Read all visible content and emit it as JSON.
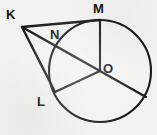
{
  "figure": {
    "type": "circle-geometry-diagram",
    "background_color": "#f2f2f0",
    "stroke_color": "#1a1a1a",
    "canvas": {
      "width": 157,
      "height": 135
    },
    "circle": {
      "name": "main-circle",
      "center_label": "O",
      "cx": 100,
      "cy": 71,
      "r": 51
    },
    "points": [
      {
        "id": "K",
        "label": "K",
        "x": 22,
        "y": 27,
        "on_circle": false,
        "label_x": 6,
        "label_y": 8
      },
      {
        "id": "M",
        "label": "M",
        "x": 100,
        "y": 20,
        "on_circle": true,
        "label_x": 93,
        "label_y": 2
      },
      {
        "id": "N",
        "label": "N",
        "x": 58,
        "y": 43,
        "on_circle": true,
        "label_x": 50,
        "label_y": 27
      },
      {
        "id": "O",
        "label": "O",
        "x": 100,
        "y": 71,
        "on_circle": false,
        "label_x": 103,
        "label_y": 61
      },
      {
        "id": "L",
        "label": "L",
        "x": 55,
        "y": 92,
        "on_circle": true,
        "label_x": 36,
        "label_y": 94
      },
      {
        "id": "P",
        "label": "",
        "x": 146,
        "y": 97,
        "on_circle": true,
        "label_x": 0,
        "label_y": 0
      }
    ],
    "segments": [
      {
        "id": "KM",
        "from": "K",
        "to": "M",
        "name": "segment-km"
      },
      {
        "id": "KL",
        "from": "K",
        "to": "L",
        "name": "segment-kl"
      },
      {
        "id": "KO",
        "from": "K",
        "to": "O",
        "name": "segment-ko-through-n"
      },
      {
        "id": "MO",
        "from": "M",
        "to": "O",
        "name": "segment-mo-radius"
      },
      {
        "id": "LO",
        "from": "L",
        "to": "O",
        "name": "segment-lo-radius"
      },
      {
        "id": "OP",
        "from": "O",
        "to": "P",
        "name": "segment-o-to-circle-radius"
      }
    ],
    "labels": {
      "k": "K",
      "m": "M",
      "n": "N",
      "o": "O",
      "l": "L"
    }
  }
}
